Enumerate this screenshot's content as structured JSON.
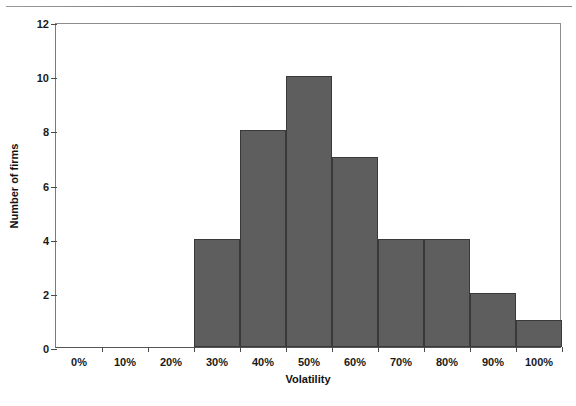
{
  "chart_data": {
    "type": "bar",
    "title": "",
    "xlabel": "Volatility",
    "ylabel": "Number of firms",
    "categories": [
      "0%",
      "10%",
      "20%",
      "30%",
      "40%",
      "50%",
      "60%",
      "70%",
      "80%",
      "90%",
      "100%"
    ],
    "values": [
      0,
      0,
      0,
      4,
      8,
      10,
      7,
      4,
      4,
      2,
      1
    ],
    "xticklabels": [
      "0%",
      "10%",
      "20%",
      "30%",
      "40%",
      "50%",
      "60%",
      "70%",
      "80%",
      "90%",
      "100%"
    ],
    "yticklabels": [
      "0",
      "2",
      "4",
      "6",
      "8",
      "10",
      "12"
    ],
    "ytickvalues": [
      0,
      2,
      4,
      6,
      8,
      10,
      12
    ],
    "ylim": [
      0,
      12
    ],
    "grid": false,
    "legend": false,
    "bar_color": "#5e5e5e",
    "bar_edge_color": "#39393a",
    "axis_color": "#4a4a4a"
  },
  "figure": {
    "y_axis_title": "Number of firms",
    "x_axis_title": "Volatility"
  }
}
